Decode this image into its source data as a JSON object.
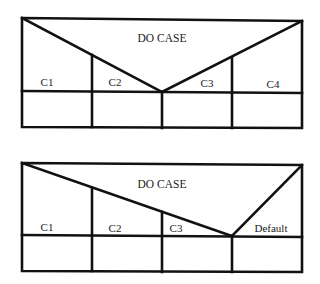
{
  "diagrams": [
    {
      "title": "DO CASE",
      "cases": [
        "C1",
        "C2",
        "C3",
        "C4"
      ]
    },
    {
      "title": "DO CASE",
      "cases": [
        "C1",
        "C2",
        "C3",
        "Default"
      ]
    }
  ],
  "colors": {
    "line": "#111111",
    "text": "#1a1a1a",
    "background": "#ffffff"
  }
}
